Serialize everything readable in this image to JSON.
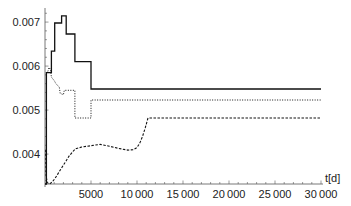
{
  "chart_data": {
    "type": "line",
    "title": "",
    "xlabel": "t[d]",
    "ylabel": "",
    "xlim": [
      0,
      30000
    ],
    "ylim": [
      0.00332,
      0.0072
    ],
    "grid": false,
    "legend": null,
    "x_ticks": [
      5000,
      10000,
      15000,
      20000,
      25000,
      30000
    ],
    "x_tick_labels": [
      "5000",
      "10 000",
      "15 000",
      "20 000",
      "25 000",
      "30 000"
    ],
    "y_ticks": [
      0.004,
      0.005,
      0.006,
      0.007
    ],
    "y_tick_labels": [
      "0.004",
      "0.005",
      "0.006",
      "0.007"
    ],
    "series": [
      {
        "name": "solid",
        "style": "solid",
        "step": true,
        "points": [
          [
            0,
            0.00332
          ],
          [
            150,
            0.00332
          ],
          [
            150,
            0.00585
          ],
          [
            700,
            0.00585
          ],
          [
            700,
            0.00634
          ],
          [
            1050,
            0.00634
          ],
          [
            1050,
            0.00698
          ],
          [
            1800,
            0.00698
          ],
          [
            1800,
            0.00714
          ],
          [
            2300,
            0.00714
          ],
          [
            2300,
            0.00673
          ],
          [
            3250,
            0.00673
          ],
          [
            3250,
            0.0061
          ],
          [
            5000,
            0.0061
          ],
          [
            5000,
            0.00548
          ],
          [
            30000,
            0.00548
          ]
        ]
      },
      {
        "name": "dotted",
        "style": "dotted",
        "step": true,
        "points": [
          [
            300,
            0.00588
          ],
          [
            450,
            0.00597
          ],
          [
            600,
            0.00592
          ],
          [
            700,
            0.00575
          ],
          [
            1000,
            0.00567
          ],
          [
            1200,
            0.0056
          ],
          [
            1550,
            0.00552
          ],
          [
            1650,
            0.00538
          ],
          [
            2000,
            0.00535
          ],
          [
            2100,
            0.00545
          ],
          [
            3250,
            0.00545
          ],
          [
            3250,
            0.00482
          ],
          [
            5000,
            0.00482
          ],
          [
            5000,
            0.00523
          ],
          [
            30000,
            0.00523
          ]
        ]
      },
      {
        "name": "dashed",
        "style": "dashed",
        "step": true,
        "points": [
          [
            80,
            0.0041
          ],
          [
            120,
            0.0035
          ],
          [
            250,
            0.00335
          ],
          [
            500,
            0.00332
          ],
          [
            800,
            0.00337
          ],
          [
            1100,
            0.00345
          ],
          [
            1400,
            0.00355
          ],
          [
            1700,
            0.00365
          ],
          [
            2000,
            0.00375
          ],
          [
            2300,
            0.00385
          ],
          [
            2600,
            0.00395
          ],
          [
            3000,
            0.00405
          ],
          [
            3300,
            0.00412
          ],
          [
            4000,
            0.00416
          ],
          [
            5000,
            0.00419
          ],
          [
            6000,
            0.00422
          ],
          [
            7000,
            0.00418
          ],
          [
            8000,
            0.00413
          ],
          [
            9000,
            0.00409
          ],
          [
            9600,
            0.0041
          ],
          [
            10000,
            0.00415
          ],
          [
            10300,
            0.00425
          ],
          [
            10600,
            0.0044
          ],
          [
            10900,
            0.0046
          ],
          [
            11200,
            0.00482
          ],
          [
            30000,
            0.00482
          ]
        ]
      }
    ]
  }
}
